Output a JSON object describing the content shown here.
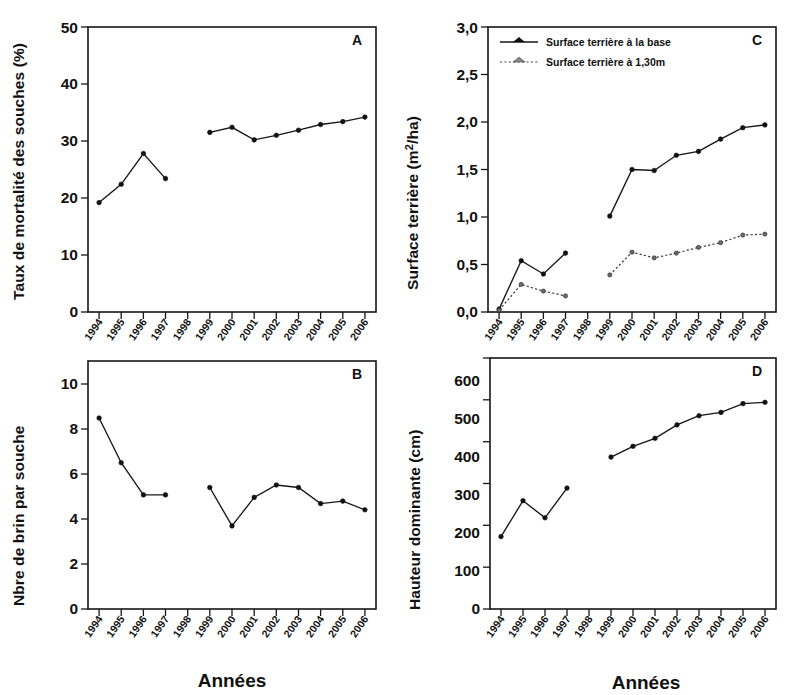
{
  "figure": {
    "xaxis_title": "Années",
    "years": [
      "1994",
      "1995",
      "1996",
      "1997",
      "1998",
      "1999",
      "2000",
      "2001",
      "2002",
      "2003",
      "2004",
      "2005",
      "2006"
    ]
  },
  "panels": {
    "a": {
      "letter": "A",
      "ylabel": "Taux de mortalité des souches (%)",
      "yticks": [
        "0",
        "10",
        "20",
        "30",
        "40",
        "50"
      ]
    },
    "b": {
      "letter": "B",
      "ylabel": "Nbre de brin par souche",
      "yticks": [
        "0",
        "2",
        "4",
        "6",
        "8",
        "10"
      ],
      "xaxis_title": "Années"
    },
    "c": {
      "letter": "C",
      "ylabel": "Surface terrière (m2/ha)",
      "ylabel_prefix": "Surface terrière (m",
      "ylabel_sup": "2",
      "ylabel_suffix": "/ha)",
      "yticks": [
        "0,0",
        "0,5",
        "1,0",
        "1,5",
        "2,0",
        "2,5",
        "3,0"
      ],
      "legend": [
        {
          "label": "Surface terrière à la base",
          "style": "solid"
        },
        {
          "label": "Surface terrière à 1,30m",
          "style": "dotted"
        }
      ]
    },
    "d": {
      "letter": "D",
      "ylabel": "Hauteur dominante (cm)",
      "yticks": [
        "0",
        "100",
        "200",
        "300",
        "400",
        "500",
        "600"
      ],
      "xaxis_title": "Années"
    }
  },
  "chart_data": [
    {
      "panel": "A",
      "type": "line",
      "title": "A",
      "xlabel": "Années",
      "ylabel": "Taux de mortalité des souches (%)",
      "ylim": [
        0,
        50
      ],
      "ytick_step": 10,
      "grid": false,
      "legend_position": "none",
      "categories": [
        "1994",
        "1995",
        "1996",
        "1997",
        "1998",
        "1999",
        "2000",
        "2001",
        "2002",
        "2003",
        "2004",
        "2005",
        "2006"
      ],
      "series": [
        {
          "name": "Taux de mortalité des souches",
          "values": [
            19.2,
            22.4,
            27.8,
            23.4,
            null,
            31.5,
            32.4,
            30.2,
            31.0,
            31.9,
            32.9,
            33.4,
            34.2
          ]
        }
      ]
    },
    {
      "panel": "B",
      "type": "line",
      "title": "B",
      "xlabel": "Années",
      "ylabel": "Nbre de brin par souche",
      "ylim": [
        0,
        10
      ],
      "ytick_step": 2,
      "grid": false,
      "legend_position": "none",
      "categories": [
        "1994",
        "1995",
        "1996",
        "1997",
        "1998",
        "1999",
        "2000",
        "2001",
        "2002",
        "2003",
        "2004",
        "2005",
        "2006"
      ],
      "series": [
        {
          "name": "Nbre de brin par souche",
          "values": [
            7.7,
            5.9,
            4.6,
            4.6,
            null,
            4.9,
            3.35,
            4.5,
            5.0,
            4.9,
            4.25,
            4.35,
            4.0
          ]
        }
      ]
    },
    {
      "panel": "C",
      "type": "line",
      "title": "C",
      "xlabel": "Années",
      "ylabel": "Surface terrière (m2/ha)",
      "ylim": [
        0.0,
        3.0
      ],
      "ytick_step": 0.5,
      "grid": false,
      "legend_position": "top-left",
      "categories": [
        "1994",
        "1995",
        "1996",
        "1997",
        "1998",
        "1999",
        "2000",
        "2001",
        "2002",
        "2003",
        "2004",
        "2005",
        "2006"
      ],
      "series": [
        {
          "name": "Surface terrière à la base",
          "values": [
            0.03,
            0.54,
            0.4,
            0.62,
            null,
            1.01,
            1.5,
            1.49,
            1.65,
            1.69,
            1.82,
            1.94,
            1.97
          ]
        },
        {
          "name": "Surface terrière à 1,30m",
          "values": [
            0.02,
            0.29,
            0.22,
            0.17,
            null,
            0.39,
            0.63,
            0.57,
            0.62,
            0.68,
            0.73,
            0.81,
            0.82
          ]
        }
      ]
    },
    {
      "panel": "D",
      "type": "line",
      "title": "D",
      "xlabel": "Années",
      "ylabel": "Hauteur dominante (cm)",
      "ylim": [
        0,
        600
      ],
      "ytick_step": 100,
      "grid": false,
      "legend_position": "none",
      "categories": [
        "1994",
        "1995",
        "1996",
        "1997",
        "1998",
        "1999",
        "2000",
        "2001",
        "2002",
        "2003",
        "2004",
        "2005",
        "2006"
      ],
      "series": [
        {
          "name": "Hauteur dominante",
          "values": [
            173,
            259,
            218,
            289,
            null,
            363,
            389,
            408,
            440,
            462,
            470,
            491,
            494
          ]
        }
      ]
    }
  ]
}
